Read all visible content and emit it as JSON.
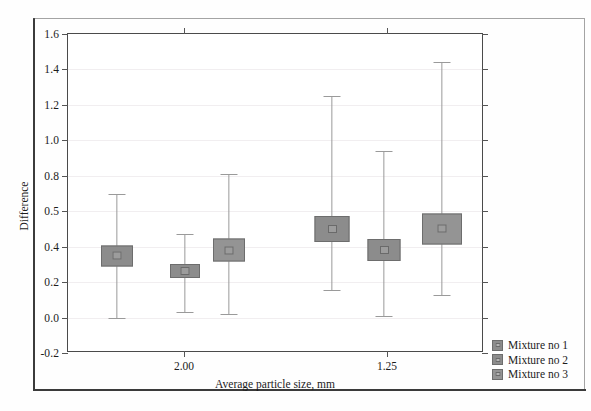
{
  "chart_data": {
    "type": "bar",
    "title": "",
    "subtitle": "",
    "xlabel": "Average particle size, mm",
    "ylabel": "Difference",
    "categories": [
      "2.00",
      "1.25"
    ],
    "xtick_labels": [
      "2.00",
      "1.25"
    ],
    "ytick_labels": [
      "1.6",
      "1.4",
      "1.2",
      "1.0",
      "0.8",
      "0.5",
      "0.4",
      "0.2",
      "0.0",
      "-0.2"
    ],
    "ytick_values": [
      1.6,
      1.4,
      1.2,
      1.0,
      0.8,
      0.6,
      0.4,
      0.2,
      0.0,
      -0.2
    ],
    "ylim": [
      -0.2,
      1.6
    ],
    "grid": true,
    "legend_position": "outside-bottom-right",
    "legend": [
      "Mixture no 1",
      "Mixture no 2",
      "Mixture no 3"
    ],
    "series": [
      {
        "name": "Mixture no 1",
        "color": "#8c8c8c",
        "values": [
          0.35,
          0.5
        ],
        "errors_low": [
          0.0,
          0.155
        ],
        "errors_high": [
          0.7,
          1.25
        ]
      },
      {
        "name": "Mixture no 2",
        "color": "#8c8c8c",
        "values": [
          0.265,
          0.38
        ],
        "errors_low": [
          0.03,
          0.01
        ],
        "errors_high": [
          0.47,
          0.94
        ]
      },
      {
        "name": "Mixture no 3",
        "color": "#949494",
        "values": [
          0.38,
          0.5
        ],
        "errors_low": [
          0.02,
          0.13
        ],
        "errors_high": [
          0.81,
          1.44
        ]
      }
    ],
    "points": [
      {
        "group": "2.00",
        "series": "Mixture no 1",
        "center": 0.35,
        "low": 0.0,
        "high": 0.7,
        "box_w": 32,
        "box_h": 21
      },
      {
        "group": "2.00",
        "series": "Mixture no 2",
        "center": 0.265,
        "low": 0.03,
        "high": 0.47,
        "box_w": 30,
        "box_h": 14
      },
      {
        "group": "2.00",
        "series": "Mixture no 3",
        "center": 0.38,
        "low": 0.02,
        "high": 0.81,
        "box_w": 32,
        "box_h": 23
      },
      {
        "group": "1.25",
        "series": "Mixture no 1",
        "center": 0.5,
        "low": 0.155,
        "high": 1.25,
        "box_w": 35,
        "box_h": 26
      },
      {
        "group": "1.25",
        "series": "Mixture no 2",
        "center": 0.38,
        "low": 0.01,
        "high": 0.94,
        "box_w": 33,
        "box_h": 22
      },
      {
        "group": "1.25",
        "series": "Mixture no 3",
        "center": 0.5,
        "low": 0.13,
        "high": 1.44,
        "box_w": 40,
        "box_h": 31
      }
    ],
    "x_positions_px": [
      116,
      184,
      228,
      331,
      383,
      441
    ],
    "xtick_positions_px": [
      183,
      386
    ],
    "colors": {
      "box_fill": "#8c8c8c",
      "box_border": "#6d6d6d",
      "whisker": "#9a9a9a",
      "axis": "#4a4a4a",
      "grid": "#f1eef0",
      "text": "#1c1c1c",
      "page_border": "#3b3b3b"
    }
  }
}
